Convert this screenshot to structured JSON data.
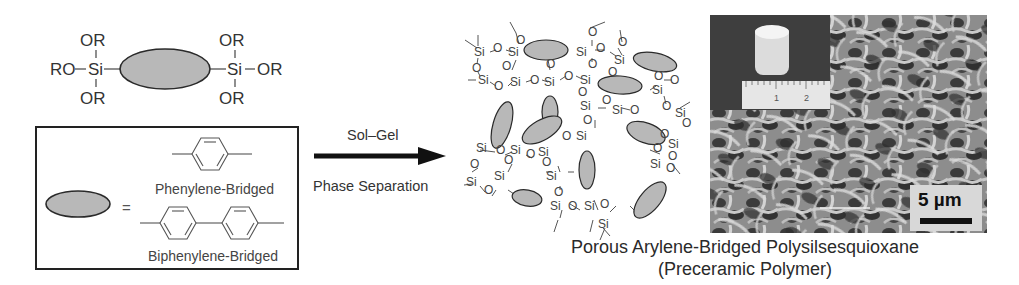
{
  "monomer": {
    "left_si": {
      "top": "OR",
      "left": "RO",
      "center": "Si",
      "bottom": "OR"
    },
    "right_si": {
      "top": "OR",
      "right": "OR",
      "center": "Si",
      "bottom": "OR"
    }
  },
  "legend_box": {
    "equals": "=",
    "options": [
      {
        "name": "phenylene",
        "label": "Phenylene-Bridged"
      },
      {
        "name": "biphenylene",
        "label": "Biphenylene-Bridged"
      }
    ]
  },
  "reaction": {
    "above_arrow": "Sol–Gel",
    "below_arrow": "Phase Separation"
  },
  "network": {
    "atom_si": "Si",
    "atom_o": "O"
  },
  "sem_image": {
    "scale_bar_label": "5 µm",
    "ruler_marks": [
      "1",
      "2"
    ]
  },
  "product": {
    "title": "Porous Arylene-Bridged Polysilsesquioxane",
    "subtitle": "(Preceramic Polymer)"
  },
  "colors": {
    "bridge_fill": "#b8b8b8",
    "bridge_stroke": "#2a2a2a",
    "line": "#444444",
    "text": "#333333"
  }
}
